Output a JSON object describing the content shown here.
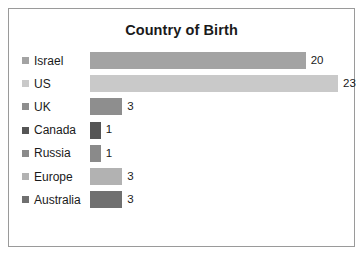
{
  "chart_data": {
    "type": "bar",
    "orientation": "horizontal",
    "title": "Country of Birth",
    "xlabel": "",
    "ylabel": "",
    "grid": false,
    "legend_position": "left",
    "show_value_labels": true,
    "xlim": [
      0,
      23
    ],
    "categories": [
      "Israel",
      "US",
      "UK",
      "Canada",
      "Russia",
      "Europe",
      "Australia"
    ],
    "values": [
      20,
      23,
      3,
      1,
      1,
      3,
      3
    ],
    "value_labels": [
      "20",
      "23",
      "3",
      "1",
      "1",
      "3",
      "3"
    ],
    "colors": [
      "#a3a3a3",
      "#c9c9c9",
      "#8e8e8e",
      "#555555",
      "#8a8a8a",
      "#b2b2b2",
      "#707070"
    ],
    "series": [
      {
        "name": "Country of Birth",
        "points": [
          {
            "category": "Israel",
            "value": 20,
            "label": "20",
            "color": "#a3a3a3"
          },
          {
            "category": "US",
            "value": 23,
            "label": "23",
            "color": "#c9c9c9"
          },
          {
            "category": "UK",
            "value": 3,
            "label": "3",
            "color": "#8e8e8e"
          },
          {
            "category": "Canada",
            "value": 1,
            "label": "1",
            "color": "#555555"
          },
          {
            "category": "Russia",
            "value": 1,
            "label": "1",
            "color": "#8a8a8a"
          },
          {
            "category": "Europe",
            "value": 3,
            "label": "3",
            "color": "#b2b2b2"
          },
          {
            "category": "Australia",
            "value": 3,
            "label": "3",
            "color": "#707070"
          }
        ]
      }
    ]
  },
  "frame": {
    "border_color": "#9a9a9a",
    "background": "#ffffff"
  }
}
